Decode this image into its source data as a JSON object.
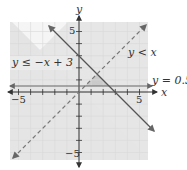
{
  "chart_data": {
    "type": "line",
    "title": "",
    "xlabel": "x",
    "ylabel": "y",
    "xlim": [
      -6,
      6
    ],
    "ylim": [
      -6,
      6
    ],
    "grid": true,
    "tick_labels": {
      "x": [
        "-5",
        "5"
      ],
      "y": [
        "5",
        "-5"
      ]
    },
    "series": [
      {
        "name": "y ≤ −x + 3",
        "style": "solid",
        "slope": -1,
        "intercept": 3,
        "shade": "below"
      },
      {
        "name": "y < x",
        "style": "dashed",
        "slope": 1,
        "intercept": 0,
        "shade": "below"
      },
      {
        "name": "y = 0.5",
        "style": "solid",
        "slope": 0,
        "intercept": 0.5
      }
    ],
    "feasible_region": {
      "vertices": [
        [
          0.5,
          0.5
        ],
        [
          1.5,
          1.5
        ],
        [
          2.5,
          0.5
        ]
      ]
    },
    "annotations": [
      "y ≤ −x + 3",
      "y < x",
      "y = 0.5"
    ]
  },
  "labels": {
    "x_axis": "x",
    "y_axis": "y",
    "line1": "y ≤ −x + 3",
    "line2": "y < x",
    "line3": "y = 0.5",
    "x_min": "−5",
    "x_max": "5",
    "y_max": "5",
    "y_min": "−5"
  },
  "colors": {
    "grid_bg": "#f3f3f3",
    "grid_line": "#dcdcdc",
    "shade": "#e2e2e2",
    "overlap": "#c8c8c8",
    "line_solid": "#555555",
    "line_dashed": "#777777",
    "axis": "#333333"
  }
}
